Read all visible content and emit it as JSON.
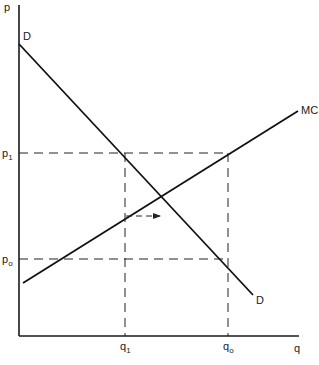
{
  "diagram": {
    "type": "economics supply-demand diagram",
    "axes": {
      "y_label": "p",
      "x_label": "q"
    },
    "curves": {
      "demand": {
        "label": "D",
        "end_label": "D"
      },
      "marginal_cost": {
        "label": "MC"
      }
    },
    "price_levels": {
      "p1": {
        "base": "p",
        "sub": "1"
      },
      "p0": {
        "base": "p",
        "sub": "o"
      }
    },
    "quantity_levels": {
      "q1": {
        "base": "q",
        "sub": "1"
      },
      "q0": {
        "base": "q",
        "sub": "o"
      }
    },
    "annotations": {
      "shift_arrow": "rightward arrow from q1 on MC"
    },
    "colors": {
      "line": "#111111",
      "background": "#ffffff"
    }
  }
}
